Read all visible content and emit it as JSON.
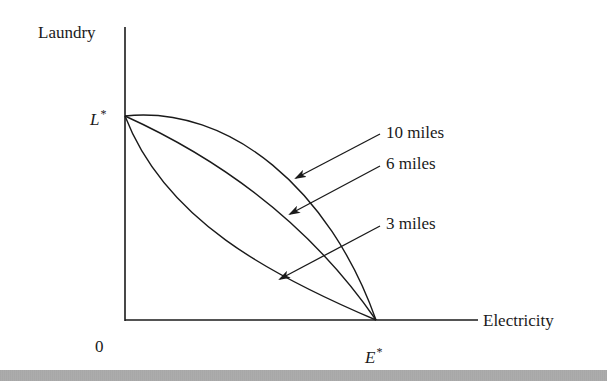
{
  "diagram": {
    "y_axis_label": "Laundry",
    "x_axis_label": "Electricity",
    "origin_label": "0",
    "y_intercept": {
      "symbol": "L",
      "superscript": "*"
    },
    "x_intercept": {
      "symbol": "E",
      "superscript": "*"
    },
    "curves": [
      {
        "label": "10 miles",
        "shape": "concave (bowed outward)"
      },
      {
        "label": "6 miles",
        "shape": "nearly linear"
      },
      {
        "label": "3 miles",
        "shape": "convex (bowed inward)"
      }
    ],
    "colors": {
      "line": "#1a1a1a",
      "background": "#ffffff"
    }
  }
}
